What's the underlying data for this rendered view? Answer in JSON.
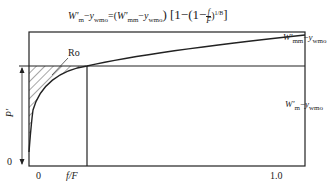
{
  "equation": {
    "lhs_W": "W'",
    "lhs_sub": "m",
    "lhs_y": "y",
    "lhs_ysub": "wmo",
    "eq": "=(",
    "rhs_W": "W'",
    "rhs_sub": "mm",
    "rhs_y": "y",
    "rhs_ysub": "wmo",
    "tail": ") [1−(1−",
    "frac_num": "f",
    "frac_den": "F",
    "exp": ")",
    "exp_sup": "1/B",
    "close": "]"
  },
  "labels": {
    "ro": "Ro",
    "p_axis": "P'",
    "y_zero": "0",
    "x_zero": "0",
    "x_fF": "f/F",
    "x_one": "1.0",
    "right_top_W": "W'",
    "right_top_sub": "mm",
    "right_top_y": "y",
    "right_top_ysub": "wmo",
    "right_mid_W": "W'",
    "right_mid_sub": "m",
    "right_mid_y": "y",
    "right_mid_ysub": "wmo"
  },
  "colors": {
    "line": "#222222",
    "background": "#ffffff"
  }
}
